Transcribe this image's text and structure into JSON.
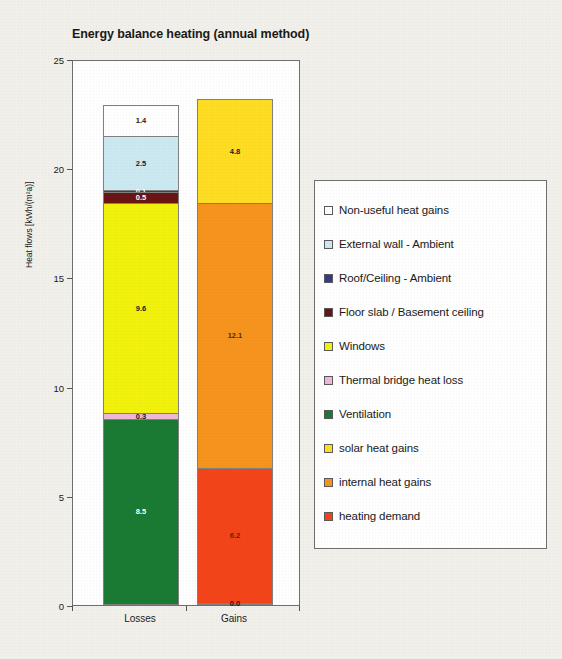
{
  "chart_data": {
    "type": "bar",
    "title": "Energy balance heating (annual method)",
    "subtitle": "",
    "xlabel": "",
    "ylabel": "Heat flows [kWh/(m²a)]",
    "ylim": [
      0,
      25
    ],
    "ytick_labels": [
      "0",
      "5",
      "10",
      "15",
      "20",
      "25"
    ],
    "ytick_values": [
      0,
      5,
      10,
      15,
      20,
      25
    ],
    "grid": false,
    "stacked": true,
    "legend_position": "right",
    "categories": [
      "Losses",
      "Gains"
    ],
    "series": [
      {
        "name": "Non-useful heat gains",
        "color": "#ffffff",
        "values": [
          1.4,
          null
        ]
      },
      {
        "name": "External wall - Ambient",
        "color": "#cce9f2",
        "values": [
          2.5,
          null
        ]
      },
      {
        "name": "Roof/Ceiling - Ambient",
        "color": "#333c8c",
        "values": [
          0.1,
          null
        ]
      },
      {
        "name": "Floor slab / Basement ceiling",
        "color": "#6b1414",
        "values": [
          0.5,
          null
        ]
      },
      {
        "name": "Windows",
        "color": "#f2f20d",
        "values": [
          9.6,
          null
        ]
      },
      {
        "name": "Thermal bridge heat loss",
        "color": "#f0b8d8",
        "values": [
          0.3,
          null
        ]
      },
      {
        "name": "Ventilation",
        "color": "#1a7a33",
        "values": [
          8.5,
          null
        ]
      },
      {
        "name": "solar heat gains",
        "color": "#ffdd22",
        "values": [
          null,
          4.8
        ]
      },
      {
        "name": "internal heat gains",
        "color": "#f7941e",
        "values": [
          null,
          12.1
        ]
      },
      {
        "name": "heating demand",
        "color": "#f4441a",
        "values": [
          null,
          6.2
        ]
      }
    ],
    "totals": {
      "Losses": 23.0,
      "Gains": 23.0
    },
    "bars": [
      {
        "category": "Losses",
        "total": 23.0,
        "segments": [
          {
            "name": "Ventilation",
            "value": 8.5,
            "label": "8.5",
            "color": "#1a7a33",
            "label_color": "light"
          },
          {
            "name": "Thermal bridge heat loss",
            "value": 0.3,
            "label": "0.3",
            "color": "#f0b8d8",
            "label_color": "dark"
          },
          {
            "name": "Windows",
            "value": 9.6,
            "label": "9.6",
            "color": "#f2f20d",
            "label_color": "dark"
          },
          {
            "name": "Floor slab / Basement ceiling",
            "value": 0.5,
            "label": "0.5",
            "color": "#6b1414",
            "label_color": "light"
          },
          {
            "name": "Roof/Ceiling - Ambient",
            "value": 0.1,
            "label": "0.1",
            "color": "#333c8c",
            "label_color": "light"
          },
          {
            "name": "External wall - Ambient",
            "value": 2.5,
            "label": "2.5",
            "color": "#cce9f2",
            "label_color": "dark"
          },
          {
            "name": "Non-useful heat gains",
            "value": 1.4,
            "label": "1.4",
            "color": "#ffffff",
            "label_color": "dark"
          }
        ]
      },
      {
        "category": "Gains",
        "total": 23.0,
        "segments": [
          {
            "name": "base",
            "value": 0.0,
            "label": "0.0",
            "color": "#ffffff",
            "label_color": "dark"
          },
          {
            "name": "heating demand",
            "value": 6.2,
            "label": "6.2",
            "color": "#f4441a",
            "label_color": "dark-on-orange"
          },
          {
            "name": "internal heat gains",
            "value": 12.1,
            "label": "12.1",
            "color": "#f7941e",
            "label_color": "dark-on-orange"
          },
          {
            "name": "solar heat gains",
            "value": 4.8,
            "label": "4.8",
            "color": "#ffdd22",
            "label_color": "dark"
          }
        ]
      }
    ]
  }
}
